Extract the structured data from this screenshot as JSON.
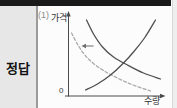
{
  "answer_panel": {
    "label": "정답"
  },
  "figure": {
    "index_label": "(1)",
    "y_axis_label": "가격",
    "x_axis_label": "수량",
    "origin_label": "0"
  },
  "colors": {
    "top_bar": "#1a1a1a",
    "panel_bg": "#e7e7e7",
    "axis": "#4a4a4a",
    "curve_solid": "#4f4f4f",
    "curve_dashed": "#a9a9a9",
    "shift_arrow": "#6b6b6b"
  },
  "chart_data": {
    "type": "line",
    "title": "",
    "xlabel": "수량",
    "ylabel": "가격",
    "origin_label": "0",
    "grid": false,
    "legend": false,
    "axes_numeric": false,
    "x_range_normalized": [
      0,
      1
    ],
    "y_range_normalized": [
      0,
      1
    ],
    "series": [
      {
        "name": "demand-original",
        "style": "solid",
        "color": "#4f4f4f",
        "points": [
          [
            0.196,
            0.974
          ],
          [
            0.272,
            0.795
          ],
          [
            0.37,
            0.628
          ],
          [
            0.489,
            0.5
          ],
          [
            0.641,
            0.397
          ],
          [
            0.815,
            0.295
          ],
          [
            1.0,
            0.218
          ]
        ]
      },
      {
        "name": "demand-shifted",
        "style": "dashed",
        "color": "#a9a9a9",
        "points": [
          [
            0.033,
            0.808
          ],
          [
            0.109,
            0.641
          ],
          [
            0.207,
            0.487
          ],
          [
            0.337,
            0.359
          ],
          [
            0.489,
            0.256
          ],
          [
            0.674,
            0.154
          ],
          [
            0.891,
            0.064
          ]
        ]
      },
      {
        "name": "supply",
        "style": "solid",
        "color": "#4f4f4f",
        "points": [
          [
            0.185,
            0.077
          ],
          [
            0.315,
            0.154
          ],
          [
            0.457,
            0.269
          ],
          [
            0.587,
            0.41
          ],
          [
            0.707,
            0.564
          ],
          [
            0.826,
            0.744
          ],
          [
            0.946,
            0.974
          ]
        ]
      }
    ],
    "annotations": [
      {
        "type": "arrow",
        "direction": "left",
        "from": [
          0.272,
          0.641
        ],
        "to": [
          0.141,
          0.641
        ],
        "meaning": "demand curve shifts left"
      }
    ]
  }
}
